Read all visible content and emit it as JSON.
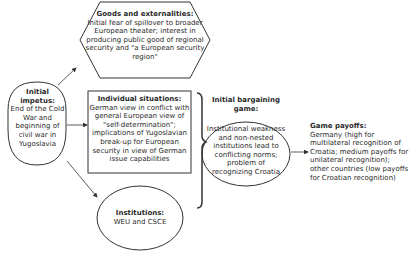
{
  "diagram": {
    "initial_impetus": {
      "title": "Initial impetus:",
      "body": "End of the Cold War and beginning of civil war in Yugoslavia"
    },
    "goods_externalities": {
      "title": "Goods and externalities:",
      "body": "Initial fear of spillover to broader European theater; interest in producing public good of regional security and \"a European security region\""
    },
    "individual_situations": {
      "title": "Individual situations:",
      "body": "German view in conflict with general European view of \"self-determination\"; implications of Yugoslavian break-up for European security in view of German issue capabilities"
    },
    "institutions": {
      "title": "Institutions:",
      "body": "WEU and CSCE"
    },
    "initial_bargaining_game": {
      "title": "Initial bargaining game:",
      "body": "Institutional weakness and non-nested institutions lead to conflicting norms; problem of recognizing Croatia"
    },
    "game_payoffs": {
      "title": "Game payoffs:",
      "body": "Germany (high for multilateral recognition of Croatia; medium payoffs for unilateral recognition); other countries (low payoffs for Croatian recognition)"
    }
  }
}
